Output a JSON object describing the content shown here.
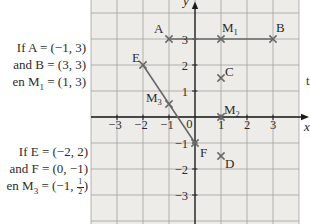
{
  "colors": {
    "page_bg": "#ffffff",
    "grid_bg": "#edece8",
    "grid_line": "#a2a2a0",
    "axis": "#1b1b1b",
    "marker": "#686868",
    "segment": "#686868",
    "text": "#2d2d2d"
  },
  "left_text": {
    "block1": {
      "line1": "If A = (−1, 3)",
      "line2": "and B = (3, 3)",
      "line3_prefix": "en M",
      "line3_sub": "1",
      "line3_suffix": " = (1, 3)"
    },
    "block2": {
      "line1": "If E = (−2, 2)",
      "line2": "and F = (0, −1)",
      "line3_prefix": "en M",
      "line3_sub": "3",
      "line3_suffix": " = (−1, ",
      "frac_numerator": "1",
      "frac_denominator": "2",
      "line3_close": ")"
    }
  },
  "chart_data": {
    "type": "scatter",
    "title": "",
    "x_axis_label": "x",
    "y_axis_label": "y",
    "right_edge_fragment": "t",
    "origin_label": "0",
    "xlim": [
      -4,
      4.2
    ],
    "ylim": [
      -4.1,
      4.5
    ],
    "grid": true,
    "marker": "x",
    "points": [
      {
        "id": "A",
        "label": "A",
        "sub": "",
        "x": -1,
        "y": 3
      },
      {
        "id": "M1",
        "label": "M",
        "sub": "1",
        "x": 1,
        "y": 3
      },
      {
        "id": "B",
        "label": "B",
        "sub": "",
        "x": 3,
        "y": 3
      },
      {
        "id": "E",
        "label": "E",
        "sub": "",
        "x": -2,
        "y": 2
      },
      {
        "id": "C",
        "label": "C",
        "sub": "",
        "x": 1,
        "y": 1.5
      },
      {
        "id": "M3",
        "label": "M",
        "sub": "3",
        "x": -1,
        "y": 0.5
      },
      {
        "id": "M2",
        "label": "M",
        "sub": "2",
        "x": 1,
        "y": 0
      },
      {
        "id": "F",
        "label": "F",
        "sub": "",
        "x": 0,
        "y": -1
      },
      {
        "id": "D",
        "label": "D",
        "sub": "",
        "x": 1,
        "y": -1.5
      }
    ],
    "segments": [
      [
        "A",
        "B"
      ],
      [
        "E",
        "F"
      ]
    ],
    "x_ticks": [
      {
        "v": -3,
        "label": "−3"
      },
      {
        "v": -2,
        "label": "−2"
      },
      {
        "v": -1,
        "label": "−1"
      },
      {
        "v": 1,
        "label": "1"
      },
      {
        "v": 2,
        "label": "2"
      },
      {
        "v": 3,
        "label": "3"
      }
    ],
    "y_ticks": [
      {
        "v": 3,
        "label": "3"
      },
      {
        "v": 2,
        "label": "2"
      },
      {
        "v": 1,
        "label": "1"
      },
      {
        "v": -1,
        "label": "−1"
      },
      {
        "v": -2,
        "label": "−2"
      },
      {
        "v": -3,
        "label": "−3"
      }
    ]
  }
}
